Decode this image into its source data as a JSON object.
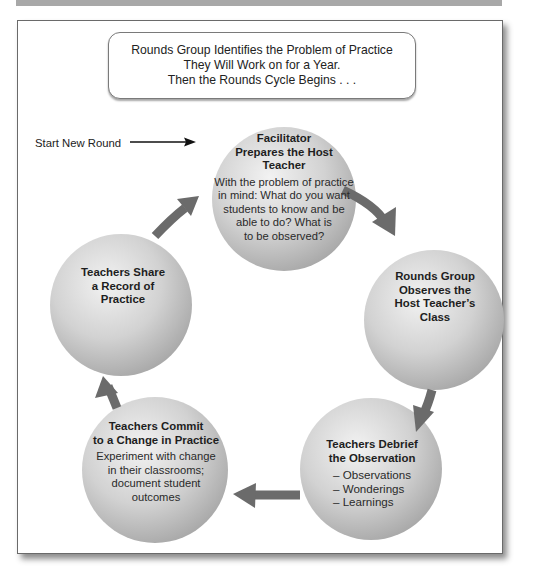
{
  "intro_box": {
    "lines": [
      "Rounds Group Identifies the Problem of Practice",
      "They Will Work on for a Year.",
      "Then the Rounds Cycle Begins . . ."
    ]
  },
  "start_label": "Start New Round",
  "colors": {
    "arrow": "#6b6b6b",
    "circle_light": "#ececec",
    "circle_dark": "#a9a9a9",
    "frame_border": "#6a6a6a",
    "top_band": "#a8a8a8"
  },
  "cycle_steps": [
    {
      "title_lines": [
        "Facilitator",
        "Prepares the Host",
        "Teacher"
      ],
      "body_lines": [
        "With the problem of practice",
        "in mind: What do you want",
        "students to know and be",
        "able to do? What is",
        "to be observed?"
      ]
    },
    {
      "title_lines": [
        "Rounds Group",
        "Observes the",
        "Host Teacher’s",
        "Class"
      ]
    },
    {
      "title_lines": [
        "Teachers Debrief",
        "the Observation"
      ],
      "bullets": [
        "– Observations",
        "– Wonderings",
        "– Learnings"
      ]
    },
    {
      "title_lines": [
        "Teachers Commit",
        "to a Change in Practice"
      ],
      "body_lines": [
        "Experiment with change",
        "in their classrooms;",
        "document student",
        "outcomes"
      ]
    },
    {
      "title_lines": [
        "Teachers Share",
        "a Record of",
        "Practice"
      ]
    }
  ]
}
